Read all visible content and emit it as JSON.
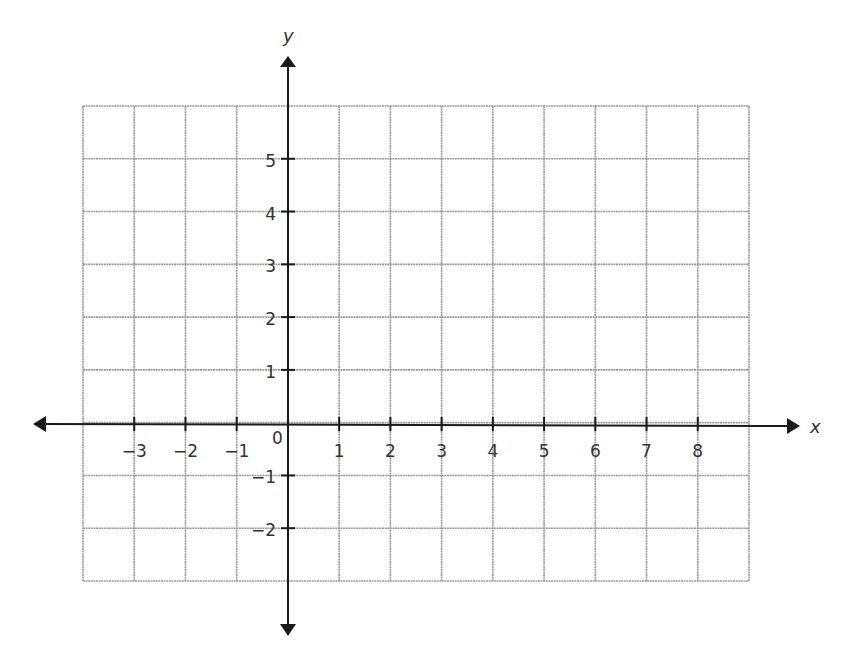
{
  "chart_data": {
    "type": "scatter",
    "title": "",
    "xlabel": "x",
    "ylabel": "y",
    "xlim": [
      -4,
      9
    ],
    "ylim": [
      -3,
      6
    ],
    "grid": true,
    "legend": null,
    "x_ticks": [
      -3,
      -2,
      -1,
      1,
      2,
      3,
      4,
      5,
      6,
      7,
      8
    ],
    "x_tick_labels": [
      "−3",
      "−2",
      "−1",
      "1",
      "2",
      "3",
      "4",
      "5",
      "6",
      "7",
      "8"
    ],
    "y_ticks": [
      -2,
      -1,
      1,
      2,
      3,
      4,
      5
    ],
    "y_tick_labels": [
      "−2",
      "−1",
      "1",
      "2",
      "3",
      "4",
      "5"
    ],
    "origin_label": "0",
    "series": [],
    "annotations": []
  },
  "axes": {
    "x_label": "x",
    "y_label": "y",
    "origin_label": "0"
  },
  "colors": {
    "grid": "#9a9a9a",
    "axis": "#1a1a1a",
    "text": "#333333",
    "background": "#ffffff"
  }
}
